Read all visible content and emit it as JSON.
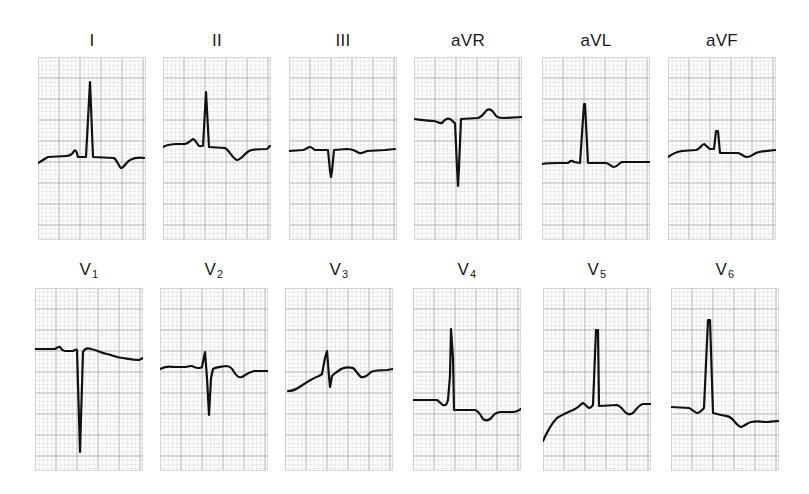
{
  "figure": {
    "grid": {
      "minor_spacing": 4.2,
      "major_every": 5,
      "minor_color": "#d2d2d2",
      "major_color": "#a8a8a8",
      "background": "#ffffff"
    },
    "trace_color": "#111111"
  },
  "rows": [
    {
      "name": "limb-leads",
      "leads": [
        {
          "id": "I",
          "label": "I",
          "sub": "",
          "x": 38,
          "y": 57,
          "label_y": 31,
          "path": "M0,106 C4,104 6,102 10,100 L28,99 C32,99 34,98 36,94 C38,92 39,96 40,100 L48,100 L52,25 L55,100 L76,101 C79,103 81,110 83,111 C86,111 88,105 92,103 C96,101 100,100 106,101"
        },
        {
          "id": "II",
          "label": "II",
          "sub": "",
          "x": 163,
          "y": 57,
          "label_y": 31,
          "path": "M0,90 C4,88 8,87 14,87 L22,87 C26,86 28,83 30,82 C33,83 34,87 36,89 L40,89 L43,35 L46,90 L62,91 C66,93 70,102 74,103 C78,103 82,96 86,94 C90,92 96,92 104,92 L107,89"
        },
        {
          "id": "III",
          "label": "III",
          "sub": "",
          "x": 289,
          "y": 57,
          "label_y": 31,
          "path": "M0,94 L14,93 C18,92 19,90 21,90 C23,90 24,92 26,93 L39,93 L41,114 L42,120 L43,114 L45,93 L58,92 C64,92 67,94 70,96 C73,97 75,95 78,94 L96,93 L106,92"
        },
        {
          "id": "aVR",
          "label": "aVR",
          "sub": "",
          "x": 414,
          "y": 57,
          "label_y": 31,
          "path": "M0,62 C8,63 14,64 20,64 C24,65 26,67 28,66 C31,62 33,61 36,62 C38,63 40,66 41,66 L43,110 L44,129 L45,110 L47,62 L64,61 C68,60 70,56 73,53 C76,51 78,53 80,56 C82,60 84,61 90,61 L108,60"
        },
        {
          "id": "aVL",
          "label": "aVL",
          "sub": "",
          "x": 542,
          "y": 57,
          "label_y": 31,
          "path": "M0,107 C6,106 12,106 18,106 L26,106 C28,104 30,103 32,105 L38,106 L42,47 L43,47 L46,106 L64,106 C68,107 70,110 72,110 C75,110 77,106 80,105 L108,105"
        },
        {
          "id": "aVF",
          "label": "aVF",
          "sub": "",
          "x": 668,
          "y": 57,
          "label_y": 31,
          "path": "M0,100 C4,97 8,95 14,94 L28,93 C32,92 34,87 36,87 C38,88 40,91 42,92 L46,92 L48,74 L50,74 L52,96 L70,96 C74,97 76,100 79,100 C82,100 84,98 88,96 C92,94 98,94 108,93"
        }
      ]
    },
    {
      "name": "precordial-leads",
      "leads": [
        {
          "id": "V1",
          "label": "V",
          "sub": "1",
          "x": 35,
          "y": 288,
          "label_y": 260,
          "path": "M0,61 L20,61 C22,60 24,58 25,59 C26,60 27,63 30,63 L38,63 C40,62 41,61 42,62 L44,130 L45,164 L46,130 L48,64 C50,60 53,60 56,61 C62,62 66,65 72,66 C78,67 82,70 88,70 C94,71 98,72 104,72 L108,70"
        },
        {
          "id": "V2",
          "label": "V",
          "sub": "2",
          "x": 160,
          "y": 288,
          "label_y": 260,
          "path": "M0,81 C4,79 8,78 14,79 L26,79 C30,78 32,77 34,79 C38,80 40,81 42,79 L45,64 L47,90 L49,127 L51,90 L53,81 C56,79 60,79 66,78 C70,78 72,80 74,84 C77,89 79,90 82,89 C86,86 90,84 94,83 L108,83"
        },
        {
          "id": "V3",
          "label": "V",
          "sub": "3",
          "x": 285,
          "y": 288,
          "label_y": 260,
          "path": "M3,103 C8,103 12,101 16,98 C22,94 28,90 34,88 L37,86 L40,70 L42,63 L44,88 L45,99 L47,88 C49,86 52,84 56,81 C60,79 64,79 68,80 C71,82 73,87 76,89 C79,90 82,88 86,84 C90,82 96,82 102,82 L108,81"
        },
        {
          "id": "V4",
          "label": "V",
          "sub": "4",
          "x": 413,
          "y": 288,
          "label_y": 260,
          "path": "M0,112 L24,112 C26,113 28,116 30,117 C33,118 34,116 35,112 L37,88 L38,41 L40,70 L41,122 L62,122 C66,123 68,128 70,131 C73,133 76,133 79,129 C82,125 84,124 88,124 L100,124 C104,124 106,122 108,121"
        },
        {
          "id": "V5",
          "label": "V",
          "sub": "5",
          "x": 543,
          "y": 288,
          "label_y": 260,
          "path": "M0,153 C4,144 8,136 14,130 C20,126 26,124 32,121 C36,119 38,116 40,115 C42,116 44,119 46,120 C48,120 49,118 50,117 L53,42 L55,42 L56,118 L74,117 C78,118 80,122 82,124 C85,127 88,127 91,124 C94,120 96,117 100,116 L108,116"
        },
        {
          "id": "V6",
          "label": "V",
          "sub": "6",
          "x": 671,
          "y": 288,
          "label_y": 260,
          "path": "M0,119 L18,120 C21,121 23,124 26,125 C29,125 31,122 33,120 L37,32 L39,32 L42,125 L50,127 C54,128 58,128 60,130 C64,133 66,138 70,139 C74,138 76,135 80,134 C84,133 88,133 94,134 C100,134 104,133 108,133"
        }
      ]
    }
  ],
  "chart_data": {
    "type": "line",
    "leads": [
      "I",
      "II",
      "III",
      "aVR",
      "aVL",
      "aVF",
      "V1",
      "V2",
      "V3",
      "V4",
      "V5",
      "V6"
    ],
    "layout": "2 rows x 6 columns",
    "grid": true,
    "qrs_morphology": {
      "I": "tall upright R, inverted T",
      "II": "upright R, inverted T",
      "III": "small negative Q/S deflection, flat-inverted T",
      "aVR": "deep negative QS, upright T",
      "aVL": "upright R, inverted T",
      "aVF": "small upright R, shallow inverted T",
      "V1": "deep QS complex",
      "V2": "small r, deep S, inverted T",
      "V3": "rS with ST elevation, inverted T",
      "V4": "tall R, inverted T",
      "V5": "tall R, inverted T",
      "V6": "tall R, inverted T"
    }
  }
}
